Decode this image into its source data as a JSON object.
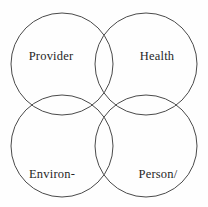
{
  "diagram": {
    "type": "venn",
    "background_color": "#fefefe",
    "stroke_color": "#4a4a4a",
    "stroke_width": 1,
    "text_color": "#262626",
    "circles": [
      {
        "id": "provider",
        "cx": 62,
        "cy": 64,
        "r": 51
      },
      {
        "id": "health",
        "cx": 146,
        "cy": 64,
        "r": 51
      },
      {
        "id": "environment",
        "cx": 62,
        "cy": 146,
        "r": 51
      },
      {
        "id": "person-family",
        "cx": 146,
        "cy": 146,
        "r": 51
      }
    ],
    "labels": {
      "provider": "Provider",
      "health": "Health",
      "environment_line1": "Environ-",
      "environment_line2": "ment",
      "person_family_line1": "Person/",
      "person_family_line2": "Family"
    }
  }
}
